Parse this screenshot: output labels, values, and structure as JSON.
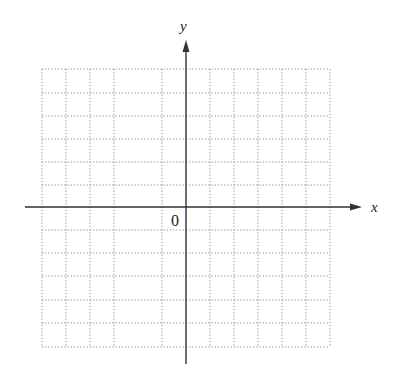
{
  "figure": {
    "type": "coordinate-grid",
    "x_axis_label": "x",
    "y_axis_label": "y",
    "origin_label": "0",
    "grid_style": "dotted",
    "colors": {
      "axis": "#333333",
      "grid": "#8a8a8a",
      "background": "#ffffff"
    },
    "grid": {
      "left": 42,
      "right": 330,
      "top": 69,
      "bottom": 347,
      "vertical_lines": [
        42,
        66,
        90,
        114,
        162,
        210,
        234,
        258,
        282,
        306,
        330
      ],
      "horizontal_lines": [
        69,
        93,
        116,
        139,
        162,
        185,
        230,
        253,
        276,
        300,
        323,
        347
      ]
    },
    "axes": {
      "origin": [
        186,
        207
      ],
      "x_start": 25,
      "x_end": 362,
      "y_top": 40,
      "y_bottom": 364
    }
  }
}
